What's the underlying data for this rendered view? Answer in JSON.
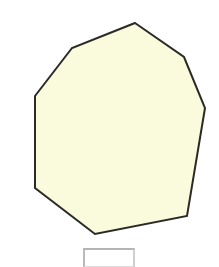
{
  "page": {
    "background_color": "#ffffff",
    "width": 219,
    "height": 267
  },
  "figure": {
    "name": "octagon",
    "label": "",
    "shape_type": "polygon",
    "sides": 8,
    "fill_color": "#FAFADC",
    "stroke_color": "#2b2a26",
    "stroke_width": 2,
    "vertices": [
      {
        "x": 135,
        "y": 23
      },
      {
        "x": 184,
        "y": 57
      },
      {
        "x": 205,
        "y": 108
      },
      {
        "x": 187,
        "y": 216
      },
      {
        "x": 95,
        "y": 234
      },
      {
        "x": 35,
        "y": 188
      },
      {
        "x": 35,
        "y": 96
      },
      {
        "x": 72,
        "y": 48
      }
    ],
    "points_attr": "135,23 184,57 205,108 187,216 95,234 35,188 35,96 72,48"
  },
  "answer_box": {
    "value": "",
    "placeholder": "",
    "border_color": "#b9b9b9",
    "fill_color": "#ffffff"
  }
}
